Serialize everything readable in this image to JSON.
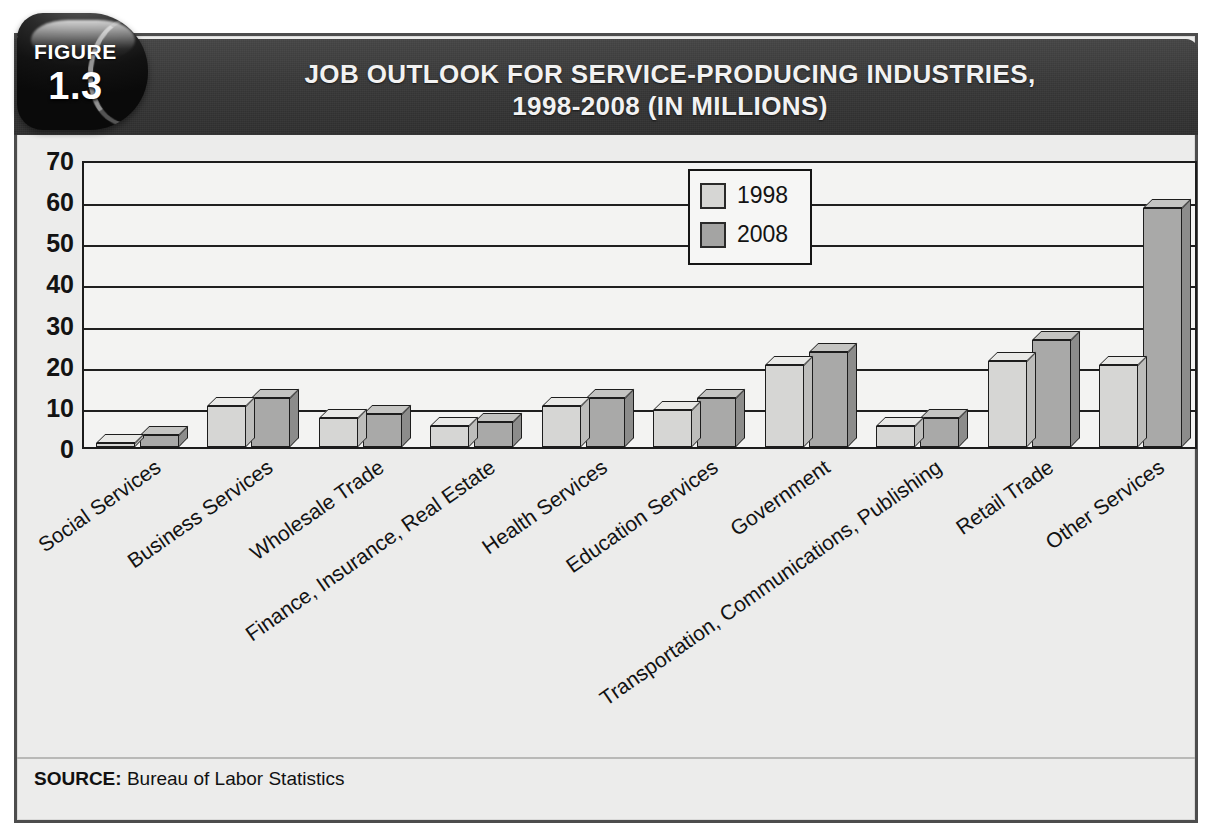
{
  "figure": {
    "badge_label": "FIGURE",
    "badge_number": "1.3"
  },
  "title": {
    "line1": "JOB OUTLOOK FOR SERVICE-PRODUCING INDUSTRIES,",
    "line2": "1998-2008 (IN MILLIONS)"
  },
  "source": {
    "label": "SOURCE:",
    "text": " Bureau of Labor Statistics"
  },
  "colors": {
    "title_bar": "#3b3b3b",
    "badge": "#141414",
    "series_1998": "#d6d6d4",
    "series_2008": "#a9a9a8",
    "plot_background": "#f3f3f2",
    "card_background": "#ececeb",
    "axis": "#1c1c1c"
  },
  "chart_data": {
    "type": "bar",
    "title": "JOB OUTLOOK FOR SERVICE-PRODUCING INDUSTRIES, 1998-2008 (IN MILLIONS)",
    "xlabel": "",
    "ylabel": "",
    "ylim": [
      0,
      70
    ],
    "yticks": [
      70,
      60,
      50,
      40,
      30,
      20,
      10,
      0
    ],
    "grid": true,
    "legend_position": "upper center",
    "categories": [
      "Social Services",
      "Business Services",
      "Wholesale Trade",
      "Finance, Insurance, Real Estate",
      "Health Services",
      "Education Services",
      "Government",
      "Transportation, Communications, Publishing",
      "Retail Trade",
      "Other Services"
    ],
    "series": [
      {
        "name": "1998",
        "values": [
          1,
          10,
          7,
          5,
          10,
          9,
          20,
          5,
          21,
          20
        ]
      },
      {
        "name": "2008",
        "values": [
          3,
          12,
          8,
          6,
          12,
          12,
          23,
          7,
          26,
          58
        ]
      }
    ]
  }
}
